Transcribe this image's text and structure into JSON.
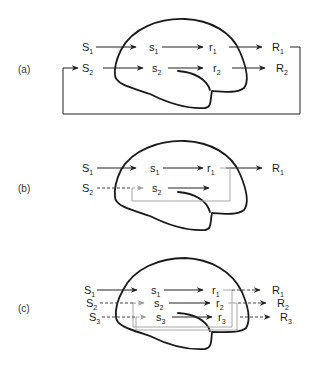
{
  "panels": [
    {
      "id": "a",
      "label": "(a)",
      "rows": [
        {
          "stimulus": "S",
          "stimulus_sub": "1",
          "sensory": "s",
          "sensory_sub": "1",
          "response_internal": "r",
          "response_internal_sub": "1",
          "response": "R",
          "response_sub": "1"
        },
        {
          "stimulus": "S",
          "stimulus_sub": "2",
          "sensory": "s",
          "sensory_sub": "2",
          "response_internal": "r",
          "response_internal_sub": "2",
          "response": "R",
          "response_sub": "2"
        }
      ],
      "feedback": "external loop from R1 back to S2"
    },
    {
      "id": "b",
      "label": "(b)",
      "rows": [
        {
          "stimulus": "S",
          "stimulus_sub": "1",
          "sensory": "s",
          "sensory_sub": "1",
          "response_internal": "r",
          "response_internal_sub": "1",
          "response": "R",
          "response_sub": "1"
        },
        {
          "stimulus": "S",
          "stimulus_sub": "2",
          "sensory": "s",
          "sensory_sub": "2"
        }
      ],
      "feedback": "internal loop from r1 back to s2 (gray); S2 input dashed"
    },
    {
      "id": "c",
      "label": "(c)",
      "rows": [
        {
          "stimulus": "S",
          "stimulus_sub": "1",
          "sensory": "s",
          "sensory_sub": "1",
          "response_internal": "r",
          "response_internal_sub": "1",
          "response": "R",
          "response_sub": "1"
        },
        {
          "stimulus": "S",
          "stimulus_sub": "2",
          "sensory": "s",
          "sensory_sub": "2",
          "response_internal": "r",
          "response_internal_sub": "2",
          "response": "R",
          "response_sub": "2"
        },
        {
          "stimulus": "S",
          "stimulus_sub": "3",
          "sensory": "s",
          "sensory_sub": "3",
          "response_internal": "r",
          "response_internal_sub": "3",
          "response": "R",
          "response_sub": "3"
        }
      ],
      "feedback": "internal loops r1→s2 and r2→s3 (gray); S2, S3 inputs and R outputs dashed"
    }
  ],
  "colors": {
    "outline": "#1a1a1a",
    "arrow": "#222222",
    "feedback_gray": "#9a9a9a"
  }
}
